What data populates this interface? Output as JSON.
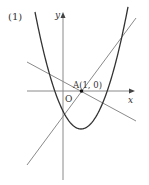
{
  "figure": {
    "problem_label": "(1)",
    "axis_x_label": "x",
    "axis_y_label": "y",
    "origin_label": "O",
    "point_label": "A(1, 0)",
    "point": {
      "name": "A",
      "x": 1,
      "y": 0
    },
    "elements": [
      {
        "type": "parabola",
        "description": "upward-opening parabola, vertex in fourth quadrant right of y-axis",
        "color": "#333333"
      },
      {
        "type": "line",
        "description": "line with positive slope through A",
        "color": "#888888"
      },
      {
        "type": "line",
        "description": "line with negative slope through A",
        "color": "#888888"
      }
    ],
    "colors": {
      "curve": "#333333",
      "lines": "#8a8a8a",
      "axes": "#8a8a8a",
      "text": "#333333"
    }
  }
}
